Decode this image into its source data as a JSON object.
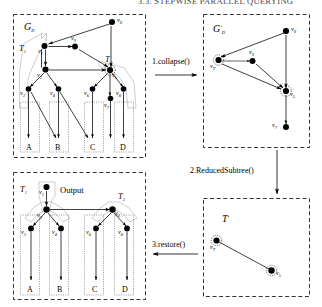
{
  "header": {
    "running_title": "3.3. STEPWISE PARALLEL QUERYING"
  },
  "figure": {
    "panels": [
      {
        "id": "gd",
        "label": "G_D",
        "label_base": "G",
        "label_sub": "D",
        "tree_labels": [
          "T",
          "T"
        ],
        "tree_subs": [
          "1",
          "2"
        ],
        "nodes": [
          "v0",
          "v9",
          "v1",
          "v2",
          "v3",
          "v4",
          "v5",
          "v6",
          "v7",
          "v8"
        ],
        "leaves": [
          "A",
          "B",
          "C",
          "D"
        ]
      },
      {
        "id": "gdprime",
        "label": "G'_D",
        "label_base": "G",
        "label_prime": "'",
        "label_sub": "D",
        "nodes": [
          "v0",
          "v9",
          "vT",
          "v5",
          "v7"
        ],
        "leaves": []
      },
      {
        "id": "output",
        "label": "Output",
        "tree_labels": [
          "T",
          "T"
        ],
        "tree_subs": [
          "1",
          "2"
        ],
        "nodes": [
          "v1",
          "v2",
          "v3",
          "v4",
          "v5",
          "v6",
          "v8"
        ],
        "leaves": [
          "A",
          "B",
          "C",
          "D"
        ]
      },
      {
        "id": "tprime",
        "label": "T'",
        "label_base": "T",
        "label_prime": "'",
        "nodes": [
          "vT",
          "v5"
        ],
        "leaves": []
      }
    ],
    "operations": [
      {
        "id": "op1",
        "label": "1.collapse()",
        "direction": "right"
      },
      {
        "id": "op2",
        "label": "2.ReducedSubtree()",
        "direction": "down"
      },
      {
        "id": "op3",
        "label": "3.restore()",
        "direction": "left"
      }
    ],
    "node_labels": {
      "v0": {
        "base": "v",
        "sub": "0"
      },
      "v1": {
        "base": "v",
        "sub": "1"
      },
      "v2": {
        "base": "v",
        "sub": "2"
      },
      "v3": {
        "base": "v",
        "sub": "3"
      },
      "v4": {
        "base": "v",
        "sub": "4"
      },
      "v5": {
        "base": "v",
        "sub": "5"
      },
      "v6": {
        "base": "v",
        "sub": "6"
      },
      "v7": {
        "base": "v",
        "sub": "7"
      },
      "v8": {
        "base": "v",
        "sub": "8"
      },
      "v9": {
        "base": "v",
        "sub": "9"
      },
      "vT": {
        "base": "v",
        "sub": "T"
      }
    },
    "leaf_labels": {
      "A": "A",
      "B": "B",
      "C": "C",
      "D": "D"
    }
  },
  "colors": {
    "stroke": "#000000",
    "hull": "#b9b9b9",
    "leafbox": "#555555",
    "background": "#ffffff"
  }
}
